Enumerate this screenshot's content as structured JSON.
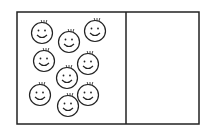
{
  "diagram": {
    "box": {
      "x": 17,
      "y": 12,
      "width": 182,
      "height": 112,
      "divider_x": 126
    },
    "compartments": [
      {
        "name": "left",
        "face_count": 9
      },
      {
        "name": "right",
        "face_count": 0
      }
    ],
    "faces": [
      {
        "cx": 42,
        "cy": 33
      },
      {
        "cx": 69,
        "cy": 42
      },
      {
        "cx": 95,
        "cy": 31
      },
      {
        "cx": 44,
        "cy": 61
      },
      {
        "cx": 88,
        "cy": 64
      },
      {
        "cx": 67,
        "cy": 78
      },
      {
        "cx": 40,
        "cy": 95
      },
      {
        "cx": 88,
        "cy": 95
      },
      {
        "cx": 68,
        "cy": 106
      }
    ],
    "colors": {
      "stroke": "#222222",
      "background": "#ffffff"
    }
  }
}
